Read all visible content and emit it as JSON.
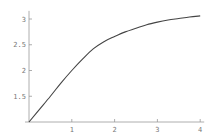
{
  "chart_data": {
    "type": "line",
    "title": "",
    "xlabel": "",
    "ylabel": "",
    "xlim": [
      0,
      4
    ],
    "ylim": [
      1,
      3.1
    ],
    "x_ticks": [
      1,
      2,
      3,
      4
    ],
    "x_tick_labels": [
      "1",
      "2",
      "3",
      "4"
    ],
    "y_ticks": [
      1.5,
      2,
      2.5,
      3
    ],
    "y_tick_labels": [
      "1.5",
      "2",
      "2.5",
      "3"
    ],
    "grid": false,
    "legend": null,
    "series": [
      {
        "name": "curve",
        "color": "#444444",
        "x": [
          0,
          0.25,
          0.5,
          0.75,
          1,
          1.25,
          1.5,
          1.75,
          2,
          2.25,
          2.5,
          2.75,
          3,
          3.25,
          3.5,
          3.75,
          4
        ],
        "y": [
          1.0,
          1.25,
          1.5,
          1.76,
          2.0,
          2.22,
          2.42,
          2.56,
          2.66,
          2.75,
          2.82,
          2.89,
          2.94,
          2.98,
          3.01,
          3.04,
          3.06
        ]
      }
    ]
  },
  "colors": {
    "axis": "#999999",
    "line": "#444444",
    "text": "#777777"
  }
}
